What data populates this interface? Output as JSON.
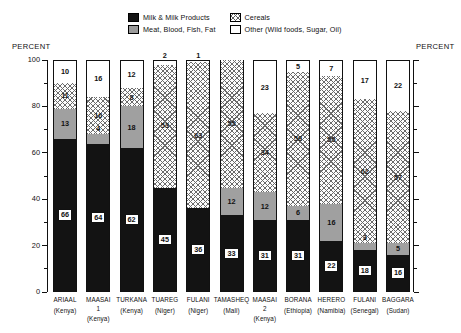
{
  "axis": {
    "left_title": "PERCENT",
    "right_title": "PERCENT",
    "ticks": [
      "100",
      "80",
      "60",
      "40",
      "20",
      "0"
    ]
  },
  "legend": {
    "items": [
      {
        "key": "milk",
        "label": "Milk & Milk Products"
      },
      {
        "key": "cereal",
        "label": "Cereals"
      },
      {
        "key": "meat",
        "label": "Meat, Blood, Fish, Fat"
      },
      {
        "key": "other",
        "label": "Other (Wild foods, Sugar, Oil)"
      }
    ]
  },
  "colors": {
    "milk": "#131313",
    "meat": "#a0a0a0",
    "cereal": "#ffffff",
    "other": "#ffffff",
    "axis": "#111111"
  },
  "chart_data": {
    "type": "bar",
    "subtype": "stacked-vertical",
    "title": "",
    "xlabel": "",
    "ylabel": "PERCENT",
    "ylim": [
      0,
      100
    ],
    "yticks": [
      0,
      20,
      40,
      60,
      80,
      100
    ],
    "yminor_step": 10,
    "grid": false,
    "legend_position": "top-center",
    "categories": [
      "ARIAAL",
      "MAASAI 1",
      "TURKANA",
      "TUAREG",
      "FULANI",
      "TAMASHEQ",
      "MAASAI 2",
      "BORANA",
      "HERERO",
      "FULANI",
      "BAGGARA"
    ],
    "category_labels": [
      {
        "name": "ARIAAL",
        "sub": "",
        "country": "(Kenya)"
      },
      {
        "name": "MAASAI",
        "sub": "1",
        "country": "(Kenya)"
      },
      {
        "name": "TURKANA",
        "sub": "",
        "country": "(Kenya)"
      },
      {
        "name": "TUAREG",
        "sub": "",
        "country": "(Niger)"
      },
      {
        "name": "FULANI",
        "sub": "",
        "country": "(Niger)"
      },
      {
        "name": "TAMASHEQ",
        "sub": "",
        "country": "(Mali)"
      },
      {
        "name": "MAASAI",
        "sub": "2",
        "country": "(Kenya)"
      },
      {
        "name": "BORANA",
        "sub": "",
        "country": "(Ethiopia)"
      },
      {
        "name": "HERERO",
        "sub": "",
        "country": "(Namibia)"
      },
      {
        "name": "FULANI",
        "sub": "",
        "country": "(Senegal)"
      },
      {
        "name": "BAGGARA",
        "sub": "",
        "country": "(Sudan)"
      }
    ],
    "series": [
      {
        "name": "Milk & Milk Products",
        "key": "milk",
        "values": [
          66,
          64,
          62,
          45,
          36,
          33,
          31,
          31,
          22,
          18,
          16
        ]
      },
      {
        "name": "Meat, Blood, Fish, Fat",
        "key": "meat",
        "values": [
          13,
          4,
          18,
          0,
          0,
          12,
          12,
          6,
          16,
          3,
          5
        ]
      },
      {
        "name": "Cereals",
        "key": "cereal",
        "values": [
          11,
          16,
          8,
          53,
          63,
          55,
          34,
          58,
          55,
          62,
          57
        ]
      },
      {
        "name": "Other (Wild foods, Sugar, Oil)",
        "key": "other",
        "values": [
          10,
          16,
          12,
          2,
          1,
          0,
          23,
          5,
          7,
          17,
          22
        ]
      }
    ]
  }
}
